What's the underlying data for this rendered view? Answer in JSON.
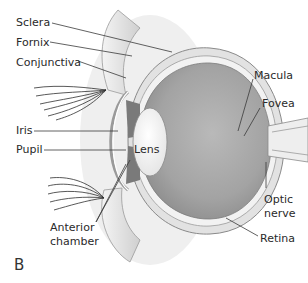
{
  "figure": {
    "panel_label": "B",
    "labels": {
      "sclera": "Sclera",
      "fornix": "Fornix",
      "conjunctiva": "Conjunctiva",
      "iris": "Iris",
      "pupil": "Pupil",
      "lens": "Lens",
      "anterior_chamber_1": "Anterior",
      "anterior_chamber_2": "chamber",
      "macula": "Macula",
      "fovea": "Fovea",
      "optic_nerve_1": "Optic",
      "optic_nerve_2": "nerve",
      "retina": "Retina"
    },
    "colors": {
      "globe_fill": "#a8a8a8",
      "wall": "#d8d8d8",
      "line": "#3a3a3a",
      "text": "#2a2a2a"
    }
  }
}
